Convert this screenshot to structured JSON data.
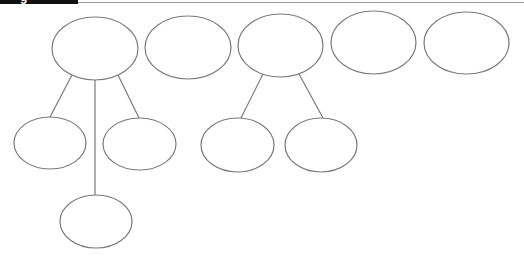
{
  "header": {
    "tab_text": "g",
    "tab_color": "#111111",
    "rule_color": "#9a9a9a"
  },
  "diagram": {
    "stroke_color": "#7a7a7a",
    "node_fill": "#ffffff",
    "nodes": [
      {
        "id": "top-1",
        "cx": 95,
        "cy": 48.5,
        "rx": 43,
        "ry": 31.5,
        "label": ""
      },
      {
        "id": "top-2",
        "cx": 188,
        "cy": 47.5,
        "rx": 43,
        "ry": 31.5,
        "label": ""
      },
      {
        "id": "top-3",
        "cx": 280.5,
        "cy": 45.5,
        "rx": 42.5,
        "ry": 31.5,
        "label": ""
      },
      {
        "id": "top-4",
        "cx": 373.5,
        "cy": 42.5,
        "rx": 42.5,
        "ry": 31.5,
        "label": ""
      },
      {
        "id": "top-5",
        "cx": 466.5,
        "cy": 43,
        "rx": 42.5,
        "ry": 31,
        "label": ""
      },
      {
        "id": "child-1a",
        "cx": 50,
        "cy": 143,
        "rx": 36,
        "ry": 26,
        "label": ""
      },
      {
        "id": "child-1b",
        "cx": 139.5,
        "cy": 144,
        "rx": 36.5,
        "ry": 26,
        "label": ""
      },
      {
        "id": "child-1c",
        "cx": 96,
        "cy": 221.5,
        "rx": 36,
        "ry": 26.5,
        "label": ""
      },
      {
        "id": "child-3a",
        "cx": 237.5,
        "cy": 145,
        "rx": 36.5,
        "ry": 27,
        "label": ""
      },
      {
        "id": "child-3b",
        "cx": 321,
        "cy": 145,
        "rx": 36,
        "ry": 27,
        "label": ""
      }
    ],
    "edges": [
      {
        "from": "top-1",
        "to": "child-1a",
        "x1": 72,
        "y1": 75,
        "x2": 50,
        "y2": 117
      },
      {
        "from": "top-1",
        "to": "child-1c",
        "x1": 95,
        "y1": 80,
        "x2": 95,
        "y2": 195
      },
      {
        "from": "top-1",
        "to": "child-1b",
        "x1": 118,
        "y1": 75,
        "x2": 139,
        "y2": 118
      },
      {
        "from": "top-3",
        "to": "child-3a",
        "x1": 263,
        "y1": 74,
        "x2": 241,
        "y2": 118
      },
      {
        "from": "top-3",
        "to": "child-3b",
        "x1": 299,
        "y1": 74,
        "x2": 323,
        "y2": 118
      }
    ]
  }
}
